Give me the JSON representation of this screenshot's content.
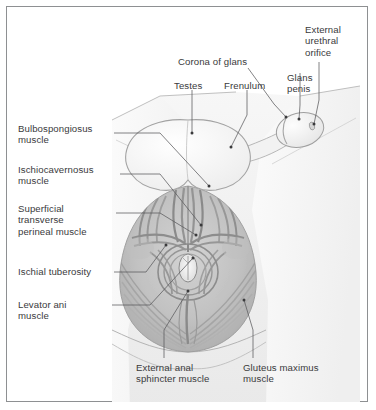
{
  "figure": {
    "type": "anatomical-illustration",
    "style": "grayscale medical line-and-tone drawing",
    "frame_color": "#8e9092",
    "background_color": "#ffffff",
    "text_color": "#3a3a3c",
    "leader_line_color": "#5a5a5c"
  },
  "labels": [
    {
      "id": "corona-of-glans",
      "text": "Corona of glans",
      "lines": [
        "Corona of glans"
      ]
    },
    {
      "id": "external-urethral-orifice",
      "text": "External urethral orifice",
      "lines": [
        "External",
        "urethral",
        "orifice"
      ]
    },
    {
      "id": "glans-penis",
      "text": "Glans penis",
      "lines": [
        "Glans",
        "penis"
      ]
    },
    {
      "id": "testes",
      "text": "Testes",
      "lines": [
        "Testes"
      ]
    },
    {
      "id": "frenulum",
      "text": "Frenulum",
      "lines": [
        "Frenulum"
      ]
    },
    {
      "id": "bulbospongiosus-muscle",
      "text": "Bulbospongiosus muscle",
      "lines": [
        "Bulbospongiosus",
        "muscle"
      ]
    },
    {
      "id": "ischiocavernosus-muscle",
      "text": "Ischiocavernosus muscle",
      "lines": [
        "Ischiocavernosus",
        "muscle"
      ]
    },
    {
      "id": "superficial-transverse-perineal-muscle",
      "text": "Superficial transverse perineal muscle",
      "lines": [
        "Superficial",
        "transverse",
        "perineal muscle"
      ]
    },
    {
      "id": "ischial-tuberosity",
      "text": "Ischial tuberosity",
      "lines": [
        "Ischial tuberosity"
      ]
    },
    {
      "id": "levator-ani-muscle",
      "text": "Levator ani muscle",
      "lines": [
        "Levator ani",
        "muscle"
      ]
    },
    {
      "id": "external-anal-sphincter-muscle",
      "text": "External anal sphincter muscle",
      "lines": [
        "External anal",
        "sphincter muscle"
      ]
    },
    {
      "id": "gluteus-maximus-muscle",
      "text": "Gluteus maximus muscle",
      "lines": [
        "Gluteus maximus",
        "muscle"
      ]
    }
  ],
  "label_text": {
    "corona_of_glans": "Corona of glans",
    "external_urethral_orifice": "External\nurethral\norifice",
    "glans_penis": "Glans\npenis",
    "testes": "Testes",
    "frenulum": "Frenulum",
    "bulbospongiosus_muscle": "Bulbospongiosus\nmuscle",
    "ischiocavernosus_muscle": "Ischiocavernosus\nmuscle",
    "superficial_transverse_perineal_muscle": "Superficial\ntransverse\nperineal muscle",
    "ischial_tuberosity": "Ischial tuberosity",
    "levator_ani_muscle": "Levator ani\nmuscle",
    "external_anal_sphincter_muscle": "External anal\nsphincter muscle",
    "gluteus_maximus_muscle": "Gluteus maximus\nmuscle"
  }
}
